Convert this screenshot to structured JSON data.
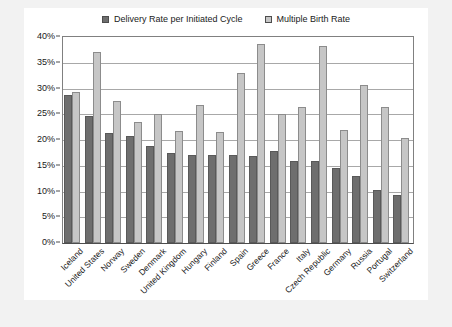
{
  "chart_data": {
    "type": "bar",
    "title": "",
    "xlabel": "",
    "ylabel": "",
    "ylim": [
      0,
      40
    ],
    "ytick_labels": [
      "0%",
      "5%",
      "10%",
      "15%",
      "20%",
      "25%",
      "30%",
      "35%",
      "40%"
    ],
    "ytick_values": [
      0,
      5,
      10,
      15,
      20,
      25,
      30,
      35,
      40
    ],
    "grid": true,
    "legend_position": "top-center",
    "categories": [
      "Iceland",
      "United States",
      "Norway",
      "Sweden",
      "Denmark",
      "United Kingdom",
      "Hungary",
      "Finland",
      "Spain",
      "Greece",
      "France",
      "Italy",
      "Czech Republic",
      "Germany",
      "Russia",
      "Portugal",
      "Switzerland"
    ],
    "series": [
      {
        "name": "Delivery Rate per Initiated Cycle",
        "color": "#6e6e6e",
        "values": [
          28.7,
          24.7,
          21.3,
          20.8,
          18.8,
          17.5,
          17.0,
          17.0,
          17.0,
          16.8,
          17.8,
          16.0,
          16.0,
          14.5,
          13.0,
          10.2,
          9.3
        ]
      },
      {
        "name": "Multiple Birth Rate",
        "color": "#c6c6c6",
        "values": [
          29.3,
          37.0,
          27.5,
          23.5,
          25.0,
          21.8,
          26.8,
          21.5,
          33.0,
          38.7,
          25.0,
          26.5,
          38.2,
          22.0,
          30.7,
          26.5,
          20.3
        ]
      }
    ]
  }
}
